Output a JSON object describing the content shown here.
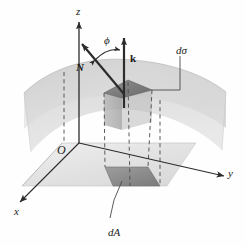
{
  "figure": {
    "background_color": "#fefefe",
    "ink_color": "#1a1a1a"
  },
  "axes": {
    "z": {
      "label": "z",
      "x": 76,
      "y": 6,
      "style": "italic"
    },
    "y": {
      "label": "y",
      "x": 228,
      "y": 168,
      "style": "italic"
    },
    "x": {
      "label": "x",
      "x": 14,
      "y": 206,
      "style": "italic"
    },
    "origin": {
      "label": "O",
      "x": 57,
      "y": 144,
      "style": "italic"
    }
  },
  "vectors": {
    "normal": {
      "label": "N",
      "x": 76,
      "y": 62,
      "style": "bold-italic"
    },
    "vertical": {
      "label": "k",
      "x": 130,
      "y": 53,
      "style": "bold-italic"
    },
    "angle": {
      "label": "ϕ",
      "x": 104,
      "y": 35,
      "style": "italic"
    }
  },
  "elements": {
    "surface_patch": {
      "label": "dσ",
      "x": 176,
      "y": 45,
      "style": "italic"
    },
    "base_patch": {
      "label": "dA",
      "x": 108,
      "y": 227,
      "style": "italic"
    }
  },
  "colors": {
    "surface_light": "#dcdcdc",
    "surface_mid": "#c4c4c4",
    "surface_dark": "#a8a8a8",
    "plane_light": "#e8e8e8",
    "plane_mid": "#d2d2d2",
    "patch_dark": "#8a8a8a",
    "patch_darker": "#6f6f6f",
    "line": "#3a3a3a",
    "dash": "#555555"
  }
}
